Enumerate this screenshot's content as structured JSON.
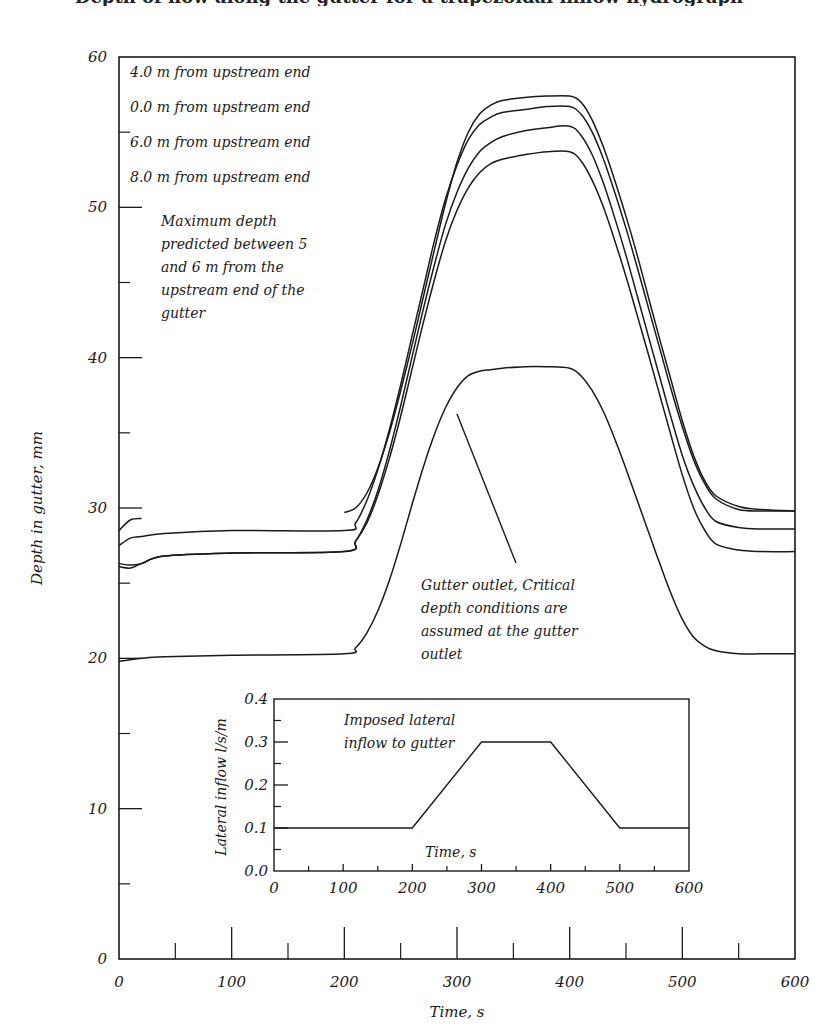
{
  "header": {
    "title_cut_off": "Depth of flow along the gutter for a trapezoidal inflow hydrograph"
  },
  "chart_data": [
    {
      "id": "main",
      "type": "line",
      "title": "",
      "xlabel": "Time, s",
      "ylabel": "Depth in gutter, mm",
      "xlim": [
        0,
        600
      ],
      "ylim": [
        0,
        60
      ],
      "x_ticks_major": [
        0,
        100,
        200,
        300,
        400,
        500,
        600
      ],
      "x_ticks_minor": [
        50,
        150,
        250,
        350,
        450,
        550
      ],
      "y_ticks_major": [
        0,
        10,
        20,
        30,
        40,
        50,
        60
      ],
      "y_ticks_minor": [
        5,
        15,
        25,
        35,
        45,
        55
      ],
      "grid": false,
      "legend_position": "upper-left (text list)",
      "legend": [
        "4.0 m from upstream end",
        "0.0 m from upstream end",
        "6.0 m from upstream end",
        "8.0 m from upstream end"
      ],
      "annotations": [
        {
          "text": [
            "Maximum depth",
            "predicted between 5",
            "and 6 m from the",
            "upstream end of the",
            "gutter"
          ],
          "x": 15,
          "y": 47.5
        },
        {
          "text": [
            "Gutter outlet, Critical",
            "depth conditions are",
            "assumed at the gutter",
            "outlet"
          ],
          "x": 272,
          "y": 26.5,
          "arrow_to": [
            308,
            36
          ]
        }
      ],
      "series": [
        {
          "name": "4.0 m from upstream end",
          "x": [
            0,
            10,
            20,
            100,
            200,
            210,
            220,
            230,
            240,
            250,
            260,
            270,
            280,
            290,
            300,
            310,
            320,
            330,
            340,
            360,
            380,
            400,
            410,
            420,
            430,
            440,
            450,
            460,
            470,
            480,
            490,
            500,
            510,
            520,
            530,
            550,
            570,
            600
          ],
          "y": [
            28.5,
            29.2,
            29.3,
            null,
            29.7,
            30.0,
            31.0,
            32.7,
            35.0,
            37.8,
            40.8,
            44.0,
            47.2,
            50.3,
            53.0,
            55.0,
            56.2,
            56.8,
            57.1,
            57.3,
            57.4,
            57.4,
            57.0,
            55.8,
            54.0,
            51.8,
            49.4,
            46.8,
            44.0,
            41.2,
            38.5,
            35.8,
            33.5,
            31.8,
            30.8,
            30.1,
            29.9,
            29.8
          ]
        },
        {
          "name": "0.0 m from upstream end",
          "x": [
            0,
            10,
            20,
            40,
            100,
            200,
            210,
            220,
            230,
            240,
            250,
            260,
            270,
            280,
            290,
            300,
            310,
            320,
            330,
            340,
            360,
            380,
            400,
            410,
            420,
            430,
            440,
            450,
            460,
            470,
            480,
            490,
            500,
            510,
            520,
            530,
            550,
            570,
            600
          ],
          "y": [
            27.5,
            28.0,
            28.1,
            28.3,
            28.5,
            28.5,
            29.0,
            30.5,
            32.6,
            35.2,
            38.2,
            41.4,
            44.6,
            47.8,
            50.6,
            52.8,
            54.5,
            55.5,
            56.0,
            56.3,
            56.5,
            56.7,
            56.7,
            56.2,
            55.0,
            53.2,
            51.0,
            48.6,
            46.0,
            43.3,
            40.6,
            37.9,
            35.4,
            33.2,
            31.6,
            30.6,
            29.9,
            29.8,
            29.8
          ]
        },
        {
          "name": "6.0 m from upstream end",
          "x": [
            0,
            10,
            20,
            40,
            100,
            200,
            210,
            220,
            230,
            240,
            250,
            260,
            270,
            280,
            290,
            300,
            310,
            320,
            330,
            340,
            360,
            380,
            400,
            410,
            420,
            430,
            440,
            450,
            460,
            470,
            480,
            490,
            500,
            510,
            520,
            530,
            550,
            570,
            600
          ],
          "y": [
            26.3,
            26.2,
            26.3,
            26.8,
            27.0,
            27.1,
            27.8,
            29.2,
            31.2,
            33.8,
            36.8,
            40.0,
            43.2,
            46.2,
            48.9,
            51.0,
            52.6,
            53.7,
            54.3,
            54.7,
            55.1,
            55.3,
            55.4,
            54.8,
            53.5,
            51.6,
            49.3,
            46.8,
            44.1,
            41.4,
            38.7,
            36.0,
            33.5,
            31.5,
            30.0,
            29.1,
            28.7,
            28.6,
            28.6
          ]
        },
        {
          "name": "8.0 m from upstream end",
          "x": [
            0,
            10,
            20,
            40,
            100,
            200,
            210,
            220,
            230,
            240,
            250,
            260,
            270,
            280,
            290,
            300,
            310,
            320,
            330,
            340,
            360,
            380,
            400,
            410,
            420,
            430,
            440,
            450,
            460,
            470,
            480,
            490,
            500,
            510,
            520,
            530,
            550,
            570,
            600
          ],
          "y": [
            26.1,
            26.0,
            26.3,
            26.8,
            27.0,
            27.1,
            27.8,
            29.0,
            30.9,
            33.3,
            36.1,
            39.2,
            42.3,
            45.2,
            47.8,
            49.8,
            51.3,
            52.3,
            52.9,
            53.2,
            53.5,
            53.7,
            53.7,
            53.1,
            51.8,
            50.0,
            47.8,
            45.4,
            42.8,
            40.2,
            37.5,
            34.8,
            32.2,
            30.0,
            28.5,
            27.6,
            27.2,
            27.1,
            27.1
          ]
        },
        {
          "name": "Gutter outlet",
          "x": [
            0,
            10,
            20,
            40,
            100,
            200,
            210,
            220,
            230,
            240,
            250,
            260,
            270,
            280,
            290,
            300,
            310,
            320,
            330,
            340,
            360,
            380,
            400,
            410,
            420,
            430,
            440,
            450,
            460,
            470,
            480,
            490,
            500,
            510,
            520,
            530,
            550,
            570,
            600
          ],
          "y": [
            19.8,
            19.9,
            20.0,
            20.1,
            20.2,
            20.3,
            20.7,
            21.7,
            23.2,
            25.2,
            27.6,
            30.2,
            32.7,
            34.9,
            36.7,
            38.0,
            38.8,
            39.1,
            39.2,
            39.3,
            39.4,
            39.4,
            39.3,
            38.8,
            37.8,
            36.4,
            34.6,
            32.6,
            30.5,
            28.4,
            26.3,
            24.3,
            22.6,
            21.4,
            20.8,
            20.5,
            20.3,
            20.3,
            20.3
          ]
        }
      ]
    },
    {
      "id": "inset",
      "type": "line",
      "title": "Imposed lateral inflow to gutter",
      "xlabel": "Time, s",
      "ylabel": "Lateral inflow l/s/m",
      "xlim": [
        0,
        600
      ],
      "ylim": [
        0.0,
        0.4
      ],
      "x_ticks_major": [
        0,
        100,
        200,
        300,
        400,
        500,
        600
      ],
      "x_ticks_minor": [
        50,
        150,
        250,
        350,
        450,
        550
      ],
      "y_ticks_major": [
        0.0,
        0.1,
        0.2,
        0.3,
        0.4
      ],
      "y_ticks_minor": [
        0.05,
        0.15,
        0.25,
        0.35
      ],
      "grid": false,
      "series": [
        {
          "name": "Imposed lateral inflow",
          "x": [
            0,
            200,
            300,
            400,
            500,
            600
          ],
          "y": [
            0.1,
            0.1,
            0.3,
            0.3,
            0.1,
            0.1
          ]
        }
      ]
    }
  ],
  "text": {
    "main_x_title": "Time, s",
    "main_y_title": "Depth in gutter, mm",
    "main_x_tick_labels": [
      "0",
      "100",
      "200",
      "300",
      "400",
      "500",
      "600"
    ],
    "main_y_tick_labels": [
      "0",
      "10",
      "20",
      "30",
      "40",
      "50",
      "60"
    ],
    "legend": [
      "4.0 m from upstream end",
      "0.0 m from upstream end",
      "6.0 m from upstream end",
      "8.0 m from upstream end"
    ],
    "note_max_depth": [
      "Maximum depth",
      "predicted between 5",
      "and 6 m from the",
      "upstream end of the",
      "gutter"
    ],
    "note_outlet": [
      "Gutter outlet, Critical",
      "depth conditions are",
      "assumed at the gutter",
      "outlet"
    ],
    "inset_title": [
      "Imposed lateral",
      "inflow to gutter"
    ],
    "inset_x_title": "Time, s",
    "inset_y_title": "Lateral inflow l/s/m",
    "inset_x_tick_labels": [
      "0",
      "100",
      "200",
      "300",
      "400",
      "500",
      "600"
    ],
    "inset_y_tick_labels": [
      "0.0",
      "0.1",
      "0.2",
      "0.3",
      "0.4"
    ]
  },
  "colors": {
    "line": "#1a1a1a",
    "background": "#ffffff"
  }
}
